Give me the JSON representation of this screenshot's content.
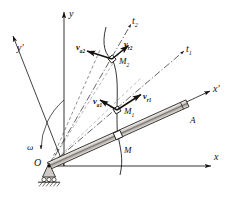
{
  "figure": {
    "background": "#ffffff",
    "ink": "#14110f",
    "width": 239,
    "height": 197
  },
  "axes": [
    {
      "name": "x-axis",
      "label": "x",
      "sub": "",
      "label_x": 214,
      "label_y": 152
    },
    {
      "name": "y-axis",
      "label": "y",
      "sub": "",
      "label_x": 69,
      "label_y": 9
    },
    {
      "name": "x-prime-axis",
      "label": "x",
      "sub": "",
      "prime": true,
      "label_x": 213,
      "label_y": 84
    },
    {
      "name": "y-prime-axis",
      "label": "y",
      "sub": "",
      "prime": true,
      "label_x": 17,
      "label_y": 43
    },
    {
      "name": "t1-axis",
      "label": "t",
      "sub": "1",
      "label_x": 186,
      "label_y": 44
    },
    {
      "name": "t2-axis",
      "label": "t",
      "sub": "2",
      "label_x": 132,
      "label_y": 16
    }
  ],
  "points": [
    {
      "name": "origin",
      "label": "O",
      "sub": "",
      "label_x": 34,
      "label_y": 158,
      "cx": 49,
      "cy": 166
    },
    {
      "name": "point-M",
      "label": "M",
      "sub": "",
      "label_x": 124,
      "label_y": 146,
      "cx": 118,
      "cy": 135
    },
    {
      "name": "point-M1",
      "label": "M",
      "sub": "1",
      "label_x": 124,
      "label_y": 107,
      "cx": 117,
      "cy": 110
    },
    {
      "name": "point-M2",
      "label": "M",
      "sub": "2",
      "label_x": 119,
      "label_y": 57,
      "cx": 112,
      "cy": 59
    },
    {
      "name": "point-A",
      "label": "A",
      "sub": "",
      "label_x": 190,
      "label_y": 116,
      "cx": 190,
      "cy": 104
    }
  ],
  "vectors": [
    {
      "name": "velocity-va2",
      "label": "v",
      "sub": "a2",
      "label_x": 76,
      "label_y": 43,
      "x1": 112,
      "y1": 59,
      "x2": 86,
      "y2": 51
    },
    {
      "name": "velocity-vr2",
      "label": "v",
      "sub": "r2",
      "label_x": 124,
      "label_y": 40,
      "x1": 112,
      "y1": 59,
      "x2": 128,
      "y2": 45
    },
    {
      "name": "velocity-va1",
      "label": "v",
      "sub": "a1",
      "label_x": 93,
      "label_y": 97,
      "x1": 117,
      "y1": 110,
      "x2": 100,
      "y2": 100
    },
    {
      "name": "velocity-vr1",
      "label": "v",
      "sub": "r1",
      "label_x": 143,
      "label_y": 92,
      "x1": 117,
      "y1": 110,
      "x2": 140,
      "y2": 95
    }
  ],
  "angle": {
    "name": "angular-velocity-omega",
    "label": "ω",
    "label_x": 27,
    "label_y": 143
  },
  "rod": {
    "name": "rod-OA",
    "from_x": 49,
    "from_y": 166,
    "to_x": 195,
    "to_y": 100
  },
  "support": {
    "name": "pin-support-hatched-ground",
    "cx": 49,
    "cy": 166
  },
  "trajectory": {
    "name": "relative-path-curve",
    "description": "curve through M2, M1, M"
  }
}
